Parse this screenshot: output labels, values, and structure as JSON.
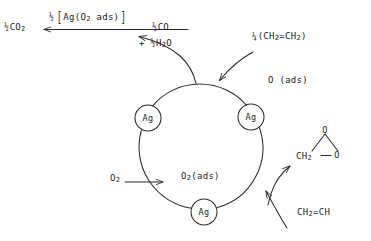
{
  "diagram": {
    "ring": {
      "cx": 201,
      "cy": 145,
      "r": 62
    },
    "nodes": [
      {
        "id": "ag-left",
        "label": "Ag",
        "x": 148,
        "y": 118,
        "r": 13
      },
      {
        "id": "ag-right",
        "label": "Ag",
        "x": 251,
        "y": 117,
        "r": 13
      },
      {
        "id": "ag-bottom",
        "label": "Ag",
        "x": 204,
        "y": 212,
        "r": 13
      }
    ],
    "labels": {
      "co2_product": {
        "frac": "½",
        "text": "CO",
        "sub": "2"
      },
      "intermediate": {
        "frac": "½",
        "open": "[",
        "text": "Ag(O",
        "sub": "2",
        "tail": " ads)",
        "close": "]"
      },
      "co_product": {
        "frac": "½",
        "text": "CO"
      },
      "water_product": {
        "plus": "+ ",
        "frac": "½",
        "text": "H",
        "sub": "2",
        "tail": "O"
      },
      "ethylene_in": {
        "frac": "¼",
        "text": "(CH",
        "sub": "2",
        "mid": "=CH",
        "sub2": "2",
        "close": ")"
      },
      "oxygen_ads": {
        "text": "O (ads)"
      },
      "oxygen_feed": {
        "text": "O",
        "sub": "2"
      },
      "dioxygen_ads": {
        "text": "O",
        "sub": "2",
        "tail": "(ads)"
      },
      "ethylene_feed": {
        "text": "CH",
        "sub": "2",
        "tail": "=CH"
      },
      "epoxide_apex": {
        "text": "O"
      },
      "epoxide_ch2": {
        "text": "CH",
        "sub": "2"
      },
      "epoxide_o": {
        "text": "O"
      }
    },
    "colors": {
      "ink": "#1c1c1c",
      "stroke": "#2a2a2a",
      "background": "#ffffff"
    }
  }
}
